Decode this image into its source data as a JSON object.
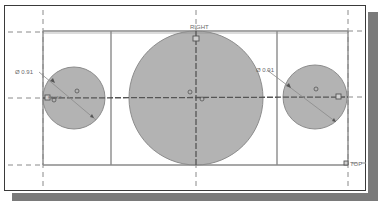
{
  "sketch": {
    "colors": {
      "background": "#ffffff",
      "frame": "#3a3a3a",
      "shadow": "#7a7a7a",
      "geometry_line": "#8a8a8a",
      "circle_fill": "#b3b3b3",
      "circle_stroke": "#8c8c8c",
      "centerline": "#555555",
      "dashed_ref": "#8a8a8a",
      "label": "#6a6a6a"
    },
    "reference_planes": {
      "right_label": "RIGHT",
      "top_label": "TOP",
      "front_label": "FRONT"
    },
    "dimensions": {
      "left_diameter": "Ø 0.91",
      "right_diameter": "Ø 0.91"
    },
    "rectangle": {
      "x": 43,
      "y": 31,
      "width": 305,
      "height": 134
    },
    "dividers": [
      111,
      277
    ],
    "circles": [
      {
        "name": "left-hole",
        "cx": 74,
        "cy": 98,
        "r": 31
      },
      {
        "name": "center-boss",
        "cx": 196,
        "cy": 98,
        "r": 67
      },
      {
        "name": "right-hole",
        "cx": 315,
        "cy": 97,
        "r": 32
      }
    ],
    "constraint_symbol": "⌀"
  }
}
